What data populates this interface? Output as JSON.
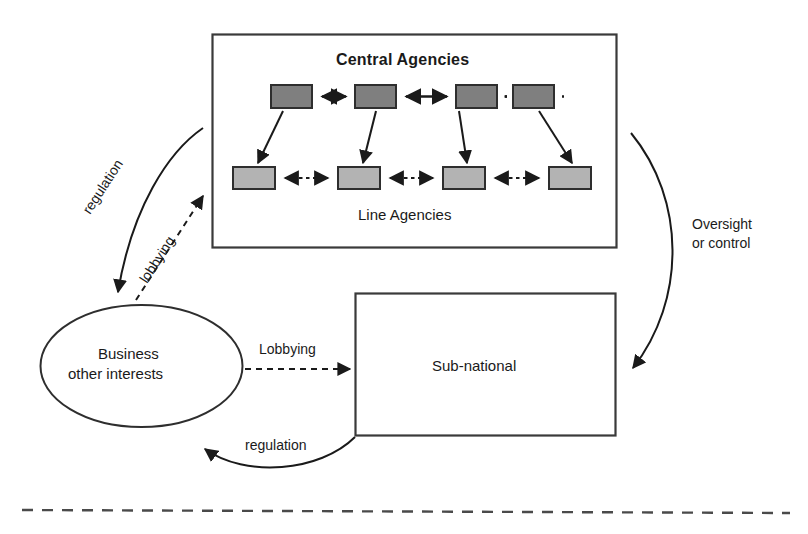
{
  "diagram": {
    "title_note": "Governance relations diagram",
    "central_container": {
      "label": "Central Agencies",
      "sublabel": "Line Agencies",
      "top_row_count": 4,
      "bottom_row_count": 4,
      "top_box_color": "#7f7f7f",
      "bottom_box_color": "#b3b3b3",
      "border_color": "#3a3a3a"
    },
    "nodes": [
      {
        "id": "business",
        "shape": "ellipse",
        "line1": "Business",
        "line2": "other interests"
      },
      {
        "id": "subnational",
        "shape": "rect",
        "label": "Sub-national"
      }
    ],
    "edges": [
      {
        "id": "regulation-top",
        "label": "regulation",
        "style": "solid",
        "direction": "central-to-business"
      },
      {
        "id": "lobbying-up",
        "label": "lobbying",
        "style": "dashed",
        "direction": "business-to-central"
      },
      {
        "id": "lobbying-right",
        "label": "Lobbying",
        "style": "dashed",
        "direction": "business-to-subnational"
      },
      {
        "id": "oversight",
        "label_line1": "Oversight",
        "label_line2": "or control",
        "style": "solid",
        "direction": "central-to-subnational"
      },
      {
        "id": "regulation-bottom",
        "label": "regulation",
        "style": "solid",
        "direction": "subnational-to-business"
      }
    ],
    "footer_divider": {
      "style": "dashed",
      "color": "#4a4a4a"
    }
  }
}
